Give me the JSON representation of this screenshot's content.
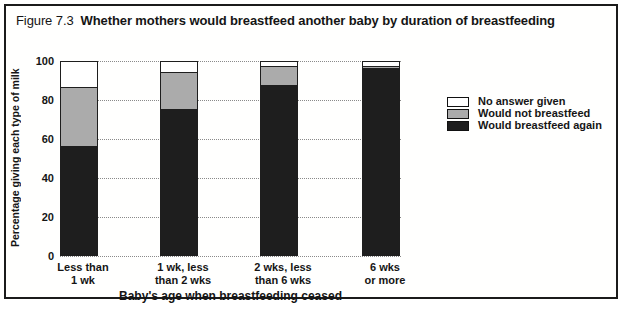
{
  "figure": {
    "label": "Figure 7.3",
    "title": "Whether mothers would breastfeed another baby by duration of breastfeeding"
  },
  "chart_data": {
    "type": "bar",
    "stacked": true,
    "title": "Whether mothers would breastfeed another baby by duration of breastfeeding",
    "xlabel": "Baby's age when breastfeeding ceased",
    "ylabel": "Percentage giving each type of milk",
    "ylim": [
      0,
      100
    ],
    "yticks": [
      100,
      80,
      60,
      40,
      20,
      0
    ],
    "grid": "horizontal-dotted",
    "legend_position": "right",
    "categories": [
      {
        "line1": "Less than",
        "line2": "1 wk",
        "full": "Less than 1 wk"
      },
      {
        "line1": "1 wk, less",
        "line2": "than 2 wks",
        "full": "1 wk, less than 2 wks"
      },
      {
        "line1": "2 wks, less",
        "line2": "than 6 wks",
        "full": "2 wks, less than 6 wks"
      },
      {
        "line1": "6 wks",
        "line2": "or more",
        "full": "6 wks or more"
      }
    ],
    "series": [
      {
        "name": "Would breastfeed again",
        "color": "#1e1e1e",
        "values": [
          56,
          75,
          87,
          96
        ]
      },
      {
        "name": "Would not breastfeed",
        "color": "#ababab",
        "values": [
          30,
          19,
          10,
          1
        ]
      },
      {
        "name": "No answer given",
        "color": "#ffffff",
        "values": [
          14,
          6,
          3,
          3
        ]
      }
    ],
    "legend": [
      {
        "label": "No answer given",
        "series_index": 2
      },
      {
        "label": "Would not breastfeed",
        "series_index": 1
      },
      {
        "label": "Would breastfeed again",
        "series_index": 0
      }
    ]
  }
}
